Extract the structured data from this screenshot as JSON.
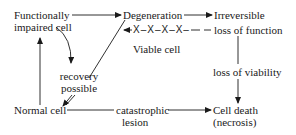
{
  "diagram": {
    "type": "cell-injury-flow",
    "nodes": {
      "functionally_impaired": {
        "line1": "Functionally",
        "line2": "impaired cell"
      },
      "degeneration": {
        "label": "Degeneration"
      },
      "irreversible": {
        "line1": "Irreversible",
        "line2": "loss of function"
      },
      "viable_cell": {
        "label": "Viable cell"
      },
      "recovery": {
        "line1": "recovery",
        "line2": "possible"
      },
      "normal_cell": {
        "label": "Normal cell"
      },
      "catastrophic": {
        "line1": "catastrophic",
        "line2": "lesion"
      },
      "loss_viability": {
        "label": "loss of viability"
      },
      "cell_death": {
        "line1": "Cell death",
        "line2": "(necrosis)"
      }
    },
    "blocked_arrow": {
      "glyphs": "X–X–X–X–"
    },
    "edges": [
      {
        "from": "Functionally impaired cell",
        "to": "Degeneration"
      },
      {
        "from": "Degeneration",
        "to": "Irreversible loss of function"
      },
      {
        "from": "Irreversible loss of function",
        "to": "Degeneration",
        "blocked": true
      },
      {
        "from": "Degeneration",
        "to": "recovery possible"
      },
      {
        "from": "Functionally impaired cell",
        "to": "recovery possible"
      },
      {
        "from": "recovery possible",
        "to": "Normal cell"
      },
      {
        "from": "Normal cell",
        "to": "Functionally impaired cell"
      },
      {
        "from": "Normal cell",
        "to": "Cell death (necrosis)",
        "via": "catastrophic lesion"
      },
      {
        "from": "Irreversible loss of function",
        "to": "Cell death (necrosis)",
        "via": "loss of viability"
      }
    ],
    "colors": {
      "ink": "#1a1a1a",
      "background": "#ffffff"
    }
  }
}
